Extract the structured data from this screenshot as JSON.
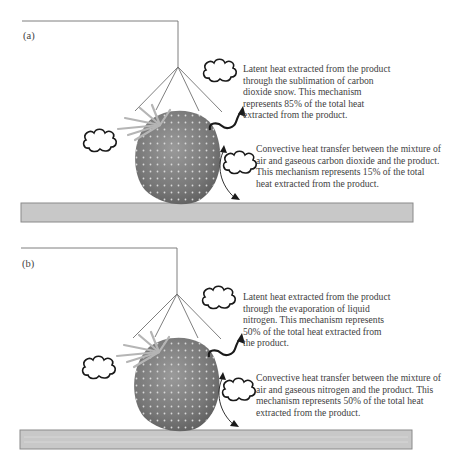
{
  "panels": [
    {
      "id": "a",
      "label": "(a)",
      "latent": {
        "lines": [
          "Latent heat extracted from the product",
          "through the sublimation of carbon",
          "dioxide snow. This mechanism",
          "represents 85% of the total heat",
          "extracted from the product."
        ],
        "percentage": "85%"
      },
      "convective": {
        "lines": [
          "Convective heat transfer between the mixture of",
          "air and gaseous carbon dioxide and the product.",
          "This mechanism represents 15% of the total",
          "heat extracted from the product."
        ],
        "percentage": "15%"
      },
      "coolant": "carbon dioxide snow"
    },
    {
      "id": "b",
      "label": "(b)",
      "latent": {
        "lines": [
          "Latent heat extracted from the product",
          "through the evaporation of liquid",
          "nitrogen. This mechanism represents",
          "50% of the total heat extracted from",
          "the product."
        ],
        "percentage": "50%"
      },
      "convective": {
        "lines": [
          "Convective heat transfer between the mixture of",
          "air and gaseous nitrogen and the product. This",
          "mechanism represents 50% of the total heat",
          "extracted from the product."
        ],
        "percentage": "50%"
      },
      "coolant": "liquid nitrogen"
    }
  ],
  "colors": {
    "tray_fill": "#c8c8c8",
    "tray_border": "#8a8a8a",
    "strawberry": "#8a8a8a",
    "line": "#707070",
    "arrow": "#1a1a1a",
    "cloud": "#1a1a1a"
  },
  "icons": {
    "cloud": "vapor-cloud-icon",
    "arrow": "heat-flow-arrow-icon",
    "product": "strawberry-icon",
    "nozzle": "spray-nozzle-icon"
  }
}
